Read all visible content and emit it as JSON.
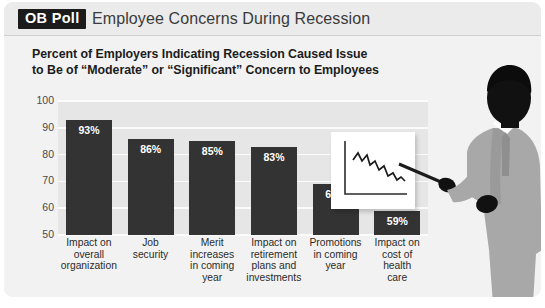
{
  "header": {
    "logo": "OB Poll",
    "title": "Employee Concerns During Recession"
  },
  "chart_title_line1": "Percent of Employers Indicating Recession Caused Issue",
  "chart_title_line2": "to Be of “Moderate” or “Significant” Concern to Employees",
  "colors": {
    "bar": "#333333",
    "plot_background": "#e6e6e6",
    "card_background": "#f2f2f2",
    "header_background": "#ebebeb",
    "gridline": "#fbfbfb",
    "logo_background": "#1b1b1b",
    "suit": "#a8a8a8",
    "skin": "#111111"
  },
  "illustration": {
    "person": "businessman-silhouette-pointing",
    "inset": "declining-line-chart-card"
  },
  "chart_data": {
    "type": "bar",
    "title": "Percent of Employers Indicating Recession Caused Issue to Be of “Moderate” or “Significant” Concern to Employees",
    "xlabel": "",
    "ylabel": "",
    "ylim": [
      50,
      100
    ],
    "yticks": [
      50,
      60,
      70,
      80,
      90,
      100
    ],
    "ytick_labels": [
      "50",
      "60",
      "70",
      "80",
      "90",
      "100"
    ],
    "grid": true,
    "legend": "none",
    "categories": [
      "Impact on overall organization",
      "Job security",
      "Merit increases in coming year",
      "Impact on retirement plans and investments",
      "Promotions in coming year",
      "Impact on cost of health care"
    ],
    "category_lines": [
      [
        "Impact on",
        "overall",
        "organization"
      ],
      [
        "Job",
        "security"
      ],
      [
        "Merit",
        "increases",
        "in coming",
        "year"
      ],
      [
        "Impact on",
        "retirement",
        "plans and",
        "investments"
      ],
      [
        "Promotions",
        "in coming",
        "year"
      ],
      [
        "Impact on",
        "cost of",
        "health",
        "care"
      ]
    ],
    "values": [
      93,
      86,
      85,
      83,
      69,
      59
    ],
    "data_labels": [
      "93%",
      "86%",
      "85%",
      "83%",
      "69%",
      "59%"
    ]
  }
}
